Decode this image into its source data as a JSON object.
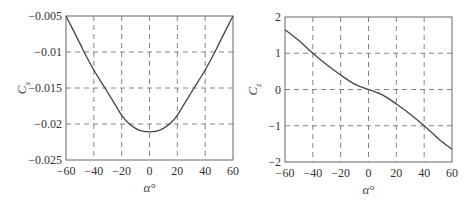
{
  "chart_data": [
    {
      "type": "line",
      "title": "",
      "xlabel": "α°",
      "ylabel": "Cx",
      "ylabel_main": "C",
      "ylabel_sub": "x",
      "xlim": [
        -60,
        60
      ],
      "ylim": [
        -0.025,
        -0.005
      ],
      "grid": true,
      "x_ticks": [
        -60,
        -40,
        -20,
        0,
        20,
        40,
        60
      ],
      "x_tick_labels": [
        "−60",
        "−40",
        "−20",
        "0",
        "20",
        "40",
        "60"
      ],
      "y_ticks": [
        -0.005,
        -0.01,
        -0.015,
        -0.02,
        -0.025
      ],
      "y_tick_labels": [
        "−0.005",
        "−0.01",
        "−0.015",
        "−0.02",
        "−0.025"
      ],
      "series": [
        {
          "name": "Cx",
          "x": [
            -60,
            -50,
            -47,
            -40,
            -32,
            -25,
            -20,
            -15,
            -10,
            -5,
            0,
            5,
            10,
            15,
            20,
            25,
            32,
            40,
            47,
            50,
            60
          ],
          "y": [
            -0.005,
            -0.0088,
            -0.01,
            -0.0125,
            -0.015,
            -0.0172,
            -0.0188,
            -0.0199,
            -0.0206,
            -0.021,
            -0.0211,
            -0.021,
            -0.0206,
            -0.0199,
            -0.0188,
            -0.0172,
            -0.015,
            -0.0125,
            -0.01,
            -0.0088,
            -0.005
          ]
        }
      ]
    },
    {
      "type": "line",
      "title": "",
      "xlabel": "α°",
      "ylabel": "Cz",
      "ylabel_main": "C",
      "ylabel_sub": "z",
      "xlim": [
        -60,
        60
      ],
      "ylim": [
        -2,
        2
      ],
      "grid": true,
      "x_ticks": [
        -60,
        -40,
        -20,
        0,
        20,
        40,
        60
      ],
      "x_tick_labels": [
        "−60",
        "−40",
        "−20",
        "0",
        "20",
        "40",
        "60"
      ],
      "y_ticks": [
        2,
        1,
        0,
        -1,
        -2
      ],
      "y_tick_labels": [
        "2",
        "1",
        "0",
        "−1",
        "−2"
      ],
      "series": [
        {
          "name": "Cz",
          "x": [
            -60,
            -50,
            -40,
            -30,
            -20,
            -10,
            0,
            10,
            20,
            30,
            40,
            50,
            60
          ],
          "y": [
            1.65,
            1.35,
            1.0,
            0.68,
            0.4,
            0.15,
            0.0,
            -0.15,
            -0.4,
            -0.68,
            -1.0,
            -1.35,
            -1.65
          ]
        }
      ]
    }
  ]
}
